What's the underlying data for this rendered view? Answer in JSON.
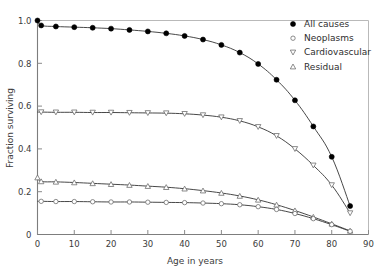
{
  "chart_data": {
    "type": "line",
    "title": "",
    "xlabel": "Age in years",
    "ylabel": "Fraction surviving",
    "xlim": [
      0,
      90
    ],
    "ylim": [
      0,
      1.0
    ],
    "xticks": [
      "0",
      "10",
      "20",
      "30",
      "40",
      "50",
      "60",
      "70",
      "80",
      "90"
    ],
    "xtick_values": [
      0,
      10,
      20,
      30,
      40,
      50,
      60,
      70,
      80,
      90
    ],
    "yticks": [
      "0",
      "0.2",
      "0.4",
      "0.6",
      "0.8",
      "1.0"
    ],
    "ytick_values": [
      0,
      0.2,
      0.4,
      0.6,
      0.8,
      1.0
    ],
    "grid": false,
    "legend_position": "top-right",
    "x": [
      0,
      1,
      5,
      10,
      15,
      20,
      25,
      30,
      35,
      40,
      45,
      50,
      55,
      60,
      65,
      70,
      75,
      80,
      85
    ],
    "series": [
      {
        "name": "All causes",
        "marker": "filled-circle",
        "values": [
          1.0,
          0.977,
          0.972,
          0.969,
          0.966,
          0.962,
          0.956,
          0.949,
          0.94,
          0.928,
          0.911,
          0.886,
          0.85,
          0.797,
          0.723,
          0.627,
          0.505,
          0.363,
          0.133
        ]
      },
      {
        "name": "Cardiovascular",
        "marker": "open-down-triangle",
        "values": [
          0.572,
          0.572,
          0.571,
          0.571,
          0.57,
          0.57,
          0.569,
          0.568,
          0.567,
          0.564,
          0.558,
          0.548,
          0.531,
          0.503,
          0.461,
          0.4,
          0.323,
          0.231,
          0.1
        ]
      },
      {
        "name": "Residual",
        "marker": "open-up-triangle",
        "values": [
          0.266,
          0.248,
          0.246,
          0.243,
          0.239,
          0.235,
          0.231,
          0.226,
          0.221,
          0.214,
          0.205,
          0.194,
          0.18,
          0.162,
          0.139,
          0.112,
          0.082,
          0.05,
          0.017
        ]
      },
      {
        "name": "Neoplasms",
        "marker": "open-circle",
        "values": [
          0.155,
          0.155,
          0.154,
          0.154,
          0.153,
          0.152,
          0.152,
          0.151,
          0.15,
          0.149,
          0.147,
          0.144,
          0.139,
          0.13,
          0.117,
          0.098,
          0.074,
          0.046,
          0.015
        ]
      }
    ],
    "legend_entries": [
      {
        "label": "All causes",
        "marker": "filled-circle"
      },
      {
        "label": "Neoplasms",
        "marker": "open-circle"
      },
      {
        "label": "Cardiovascular",
        "marker": "open-down-triangle"
      },
      {
        "label": "Residual",
        "marker": "open-up-triangle"
      }
    ],
    "colors": {
      "line": "#333333",
      "marker_fill_open": "#ffffff",
      "marker_fill_solid": "#000000",
      "axis": "#8a8a8a",
      "text": "#3b3b3b",
      "background": "#ffffff"
    }
  }
}
